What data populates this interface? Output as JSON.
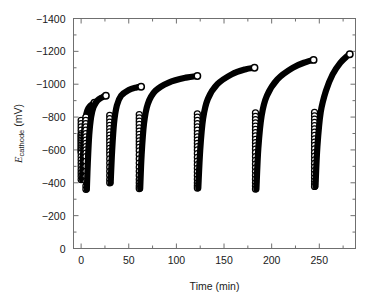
{
  "chart_data": {
    "type": "line",
    "title": "",
    "xlabel": "Time (min)",
    "ylabel_symbol": "E",
    "ylabel_subscript": "cathode",
    "ylabel_units": " (mV)",
    "ylabel_full": "Ecathode (mV)",
    "xlim": [
      -8,
      288
    ],
    "ylim": [
      -1400,
      0
    ],
    "y_inverted": true,
    "grid": false,
    "legend": null,
    "marker": "open-circle",
    "xticks": [
      0,
      50,
      100,
      150,
      200,
      250
    ],
    "xtick_labels": [
      "0",
      "50",
      "100",
      "150",
      "200",
      "250"
    ],
    "x_minor_ticks": [
      25,
      75,
      125,
      175,
      225,
      275
    ],
    "yticks": [
      -1400,
      -1200,
      -1000,
      -800,
      -600,
      -400,
      -200,
      0
    ],
    "ytick_labels": [
      "-1400",
      "-1200",
      "-1000",
      "-800",
      "-600",
      "-400",
      "-200",
      "0"
    ],
    "y_minor_ticks": [
      -1300,
      -1100,
      -900,
      -700,
      -500,
      -300,
      -100
    ],
    "series": [
      {
        "name": "cycle-1",
        "t_start": 0,
        "drop_points": [
          -780,
          -760,
          -740,
          -720,
          -700,
          -690,
          -680,
          -670,
          -660,
          -650,
          -640,
          -630,
          -620,
          -610,
          -600,
          -590,
          -580,
          -560,
          -540,
          -520,
          -500,
          -480,
          -460,
          -440,
          -420
        ],
        "curve": [
          [
            1.0,
            -420
          ],
          [
            2.0,
            -560
          ],
          [
            3.0,
            -700
          ],
          [
            4.5,
            -790
          ],
          [
            6.5,
            -840
          ],
          [
            9.0,
            -865
          ],
          [
            12.0,
            -880
          ],
          [
            14.0,
            -888
          ]
        ],
        "end_point": [
          14.0,
          -888
        ]
      },
      {
        "name": "cycle-2",
        "t_start": 5,
        "drop_points": [
          -800,
          -780,
          -760,
          -740,
          -720,
          -700,
          -680,
          -660,
          -640,
          -620,
          -600,
          -580,
          -560,
          -530,
          -500,
          -470,
          -440,
          -410,
          -380,
          -360
        ],
        "curve": [
          [
            6.0,
            -360
          ],
          [
            7.0,
            -520
          ],
          [
            8.5,
            -690
          ],
          [
            10.5,
            -800
          ],
          [
            13.0,
            -860
          ],
          [
            17.0,
            -900
          ],
          [
            22.0,
            -920
          ],
          [
            26.0,
            -930
          ]
        ],
        "end_point": [
          26.0,
          -930
        ]
      },
      {
        "name": "cycle-3",
        "t_start": 30,
        "drop_points": [
          -810,
          -790,
          -770,
          -750,
          -730,
          -710,
          -690,
          -670,
          -650,
          -630,
          -610,
          -590,
          -570,
          -545,
          -520,
          -495,
          -470,
          -445,
          -420,
          -400
        ],
        "curve": [
          [
            31.0,
            -400
          ],
          [
            32.5,
            -590
          ],
          [
            34.5,
            -760
          ],
          [
            37.5,
            -870
          ],
          [
            42.0,
            -930
          ],
          [
            50.0,
            -965
          ],
          [
            58.0,
            -980
          ],
          [
            63.0,
            -985
          ]
        ],
        "end_point": [
          63.0,
          -985
        ]
      },
      {
        "name": "cycle-4",
        "t_start": 61,
        "drop_points": [
          -815,
          -795,
          -775,
          -755,
          -735,
          -715,
          -695,
          -675,
          -655,
          -635,
          -615,
          -595,
          -570,
          -545,
          -520,
          -495,
          -470,
          -445,
          -420,
          -400,
          -380,
          -365
        ],
        "curve": [
          [
            62.0,
            -365
          ],
          [
            63.5,
            -570
          ],
          [
            66.0,
            -760
          ],
          [
            70.0,
            -880
          ],
          [
            78.0,
            -960
          ],
          [
            92.0,
            -1010
          ],
          [
            110.0,
            -1040
          ],
          [
            122.0,
            -1050
          ]
        ],
        "end_point": [
          122.0,
          -1050
        ]
      },
      {
        "name": "cycle-5",
        "t_start": 122,
        "drop_points": [
          -820,
          -800,
          -780,
          -760,
          -740,
          -720,
          -700,
          -680,
          -660,
          -640,
          -620,
          -600,
          -578,
          -555,
          -532,
          -510,
          -488,
          -466,
          -444,
          -422,
          -400,
          -382,
          -368
        ],
        "curve": [
          [
            123.0,
            -368
          ],
          [
            125.0,
            -600
          ],
          [
            128.0,
            -790
          ],
          [
            133.0,
            -910
          ],
          [
            143.0,
            -1000
          ],
          [
            158.0,
            -1060
          ],
          [
            172.0,
            -1090
          ],
          [
            182.0,
            -1100
          ]
        ],
        "end_point": [
          182.0,
          -1100
        ]
      },
      {
        "name": "cycle-6",
        "t_start": 183,
        "drop_points": [
          -825,
          -805,
          -785,
          -765,
          -745,
          -725,
          -705,
          -685,
          -665,
          -645,
          -625,
          -605,
          -583,
          -560,
          -537,
          -514,
          -491,
          -468,
          -445,
          -422,
          -400,
          -380,
          -362
        ],
        "curve": [
          [
            184.0,
            -362
          ],
          [
            186.0,
            -610
          ],
          [
            189.5,
            -810
          ],
          [
            195.0,
            -930
          ],
          [
            206.0,
            -1030
          ],
          [
            222.0,
            -1100
          ],
          [
            236.0,
            -1135
          ],
          [
            244.0,
            -1148
          ]
        ],
        "end_point": [
          244.0,
          -1148
        ]
      },
      {
        "name": "cycle-7",
        "t_start": 245,
        "drop_points": [
          -828,
          -808,
          -788,
          -768,
          -748,
          -728,
          -708,
          -688,
          -668,
          -648,
          -628,
          -606,
          -584,
          -562,
          -540,
          -518,
          -496,
          -474,
          -452,
          -430,
          -410,
          -392,
          -378
        ],
        "curve": [
          [
            246.0,
            -378
          ],
          [
            248.0,
            -620
          ],
          [
            251.5,
            -830
          ],
          [
            257.0,
            -960
          ],
          [
            264.0,
            -1060
          ],
          [
            272.0,
            -1130
          ],
          [
            279.0,
            -1170
          ],
          [
            282.0,
            -1182
          ]
        ],
        "end_point": [
          282.0,
          -1182
        ]
      }
    ]
  }
}
